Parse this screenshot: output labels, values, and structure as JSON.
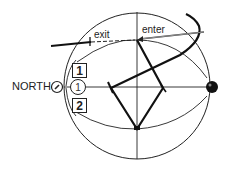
{
  "diagram": {
    "labels": {
      "exit": "exit",
      "enter": "enter",
      "north": "NORTH"
    },
    "markers": {
      "box_1": "1",
      "box_2": "2",
      "circle_1": "1"
    },
    "colors": {
      "stroke": "#222222",
      "background": "#ffffff"
    },
    "icons": {
      "north-indicator": "circle with tick",
      "sun": "filled black ball on right edge"
    }
  }
}
